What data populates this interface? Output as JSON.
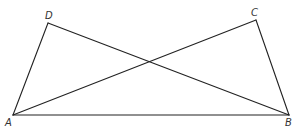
{
  "diagram": {
    "points": {
      "A": {
        "label": "A",
        "x": 13,
        "y": 115
      },
      "B": {
        "label": "B",
        "x": 289,
        "y": 115
      },
      "C": {
        "label": "C",
        "x": 256,
        "y": 20
      },
      "D": {
        "label": "D",
        "x": 48,
        "y": 23
      }
    },
    "segments": [
      "AB",
      "AD",
      "AC",
      "BD",
      "BC"
    ],
    "line_color": "#222222"
  }
}
